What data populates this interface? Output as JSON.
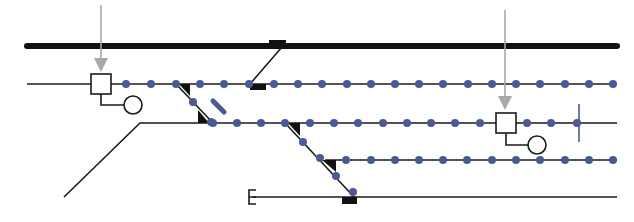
{
  "colors": {
    "background": "#ffffff",
    "track": "#1a1a1a",
    "main_line": "#111111",
    "dot": "#4b5a96",
    "arrow": "#a8a8a8",
    "signal_fill": "#ffffff",
    "marker": "#111111"
  },
  "labels": {
    "end_marker": "E"
  },
  "tracks": [
    {
      "id": "main-line",
      "y": 46,
      "x1": 27,
      "x2": 617,
      "heavy": true
    },
    {
      "id": "track-1",
      "y": 84,
      "x1": 27,
      "x2": 617
    },
    {
      "id": "track-2",
      "y": 123,
      "x1": 140,
      "x2": 617
    },
    {
      "id": "track-3",
      "y": 160,
      "x1": 325,
      "x2": 617
    },
    {
      "id": "track-4",
      "y": 197,
      "x1": 253,
      "x2": 617
    }
  ],
  "dots": {
    "track-1": [
      126,
      151,
      176,
      200,
      224,
      249,
      274,
      298,
      322,
      347,
      371,
      395,
      419,
      443,
      468,
      492,
      516,
      540,
      565,
      589,
      613
    ],
    "track-2": [
      213,
      237,
      261,
      285,
      310,
      334,
      358,
      383,
      407,
      431,
      455,
      480,
      527,
      551,
      577
    ],
    "track-3": [
      346,
      371,
      395,
      419,
      443,
      467,
      492,
      516,
      540,
      565,
      589,
      613
    ],
    "diagonal-1": [
      193,
      209
    ],
    "diagonal-2": [
      303,
      336,
      353
    ]
  },
  "signals": [
    {
      "id": "signal-left",
      "x": 100,
      "y": 84,
      "arrow_top": 5
    },
    {
      "id": "signal-right",
      "x": 506,
      "y": 123,
      "arrow_top": 10
    }
  ]
}
